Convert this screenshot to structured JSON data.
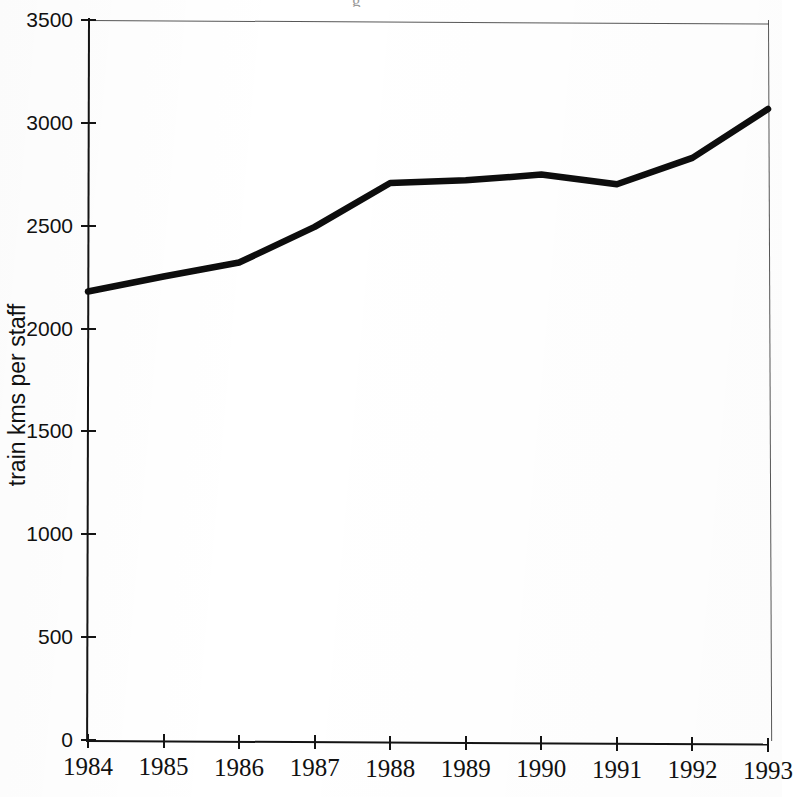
{
  "figure": {
    "clipped_caption_fragment": "g",
    "background_color": "#ffffff",
    "line_color": "#0d0d0d",
    "axis_color": "#141414"
  },
  "chart_data": {
    "type": "line",
    "title": "",
    "xlabel": "",
    "ylabel": "train kms per staff",
    "x": [
      1984,
      1985,
      1986,
      1987,
      1988,
      1989,
      1990,
      1991,
      1992,
      1993
    ],
    "categories": [
      "1984",
      "1985",
      "1986",
      "1987",
      "1988",
      "1989",
      "1990",
      "1991",
      "1992",
      "1993"
    ],
    "values": [
      2180,
      2255,
      2325,
      2500,
      2715,
      2730,
      2760,
      2715,
      2845,
      3085
    ],
    "series": [
      {
        "name": "train kms per staff",
        "values": [
          2180,
          2255,
          2325,
          2500,
          2715,
          2730,
          2760,
          2715,
          2845,
          3085
        ]
      }
    ],
    "ylim": [
      0,
      3500
    ],
    "xlim": [
      1984,
      1993
    ],
    "ytick_labels": [
      "0",
      "500",
      "1000",
      "1500",
      "2000",
      "2500",
      "3000",
      "3500"
    ],
    "ytick_values": [
      0,
      500,
      1000,
      1500,
      2000,
      2500,
      3000,
      3500
    ],
    "xtick_labels": [
      "1984",
      "1985",
      "1986",
      "1987",
      "1988",
      "1989",
      "1990",
      "1991",
      "1992",
      "1993"
    ],
    "grid": false,
    "legend": false,
    "legend_position": "none"
  }
}
